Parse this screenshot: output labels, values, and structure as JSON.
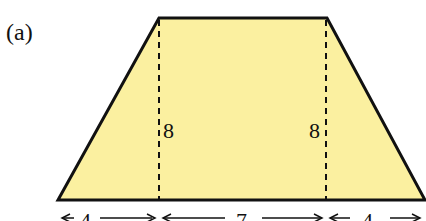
{
  "figure": {
    "part_label": "(a)",
    "shape": "trapezoid",
    "fill_color": "#fbf0a0",
    "stroke_color": "#111111",
    "height_labels": [
      "8",
      "8"
    ],
    "base_segments": [
      {
        "label": "4"
      },
      {
        "label": "7"
      },
      {
        "label": "4"
      }
    ]
  }
}
